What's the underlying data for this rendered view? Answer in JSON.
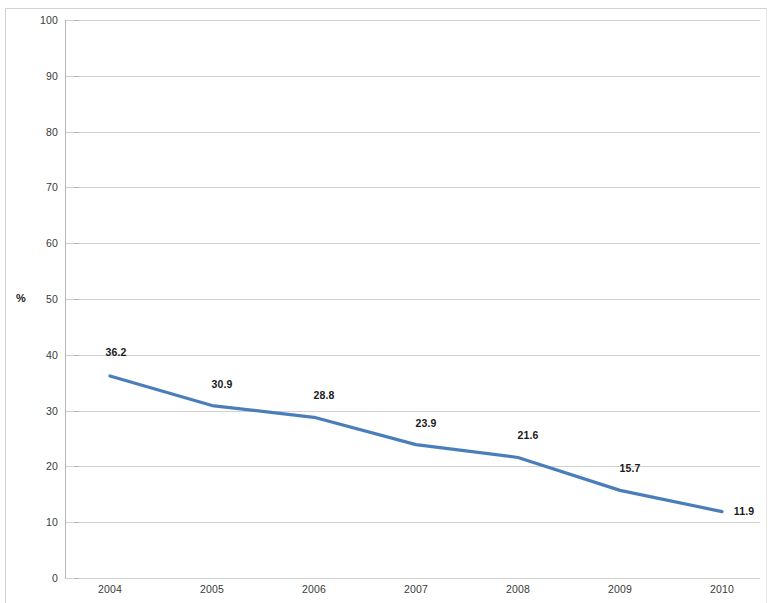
{
  "chart_data": {
    "type": "line",
    "title": "",
    "subtitle": "",
    "xlabel": "",
    "ylabel": "%",
    "categories": [
      "2004",
      "2005",
      "2006",
      "2007",
      "2008",
      "2009",
      "2010"
    ],
    "series": [
      {
        "name": "",
        "values": [
          36.2,
          30.9,
          28.8,
          23.9,
          21.6,
          15.7,
          11.9
        ],
        "color": "#4A7EBB",
        "show_data_labels": true
      }
    ],
    "ylim": [
      0,
      100
    ],
    "y_ticks": [
      0,
      10,
      20,
      30,
      40,
      50,
      60,
      70,
      80,
      90,
      100
    ],
    "y_tick_labels": [
      "0",
      "10",
      "20",
      "30",
      "40",
      "50",
      "60",
      "70",
      "80",
      "90",
      "100"
    ],
    "data_labels": [
      "36.2",
      "30.9",
      "28.8",
      "23.9",
      "21.6",
      "15.7",
      "11.9"
    ],
    "grid": true,
    "grid_axis": "y",
    "legend": false,
    "legend_position": "none",
    "gridline_color": "#D0D0D0",
    "axis_color": "#B8B8B8",
    "background_color": "#FFFFFF",
    "label_color": "#1A1A1A"
  }
}
